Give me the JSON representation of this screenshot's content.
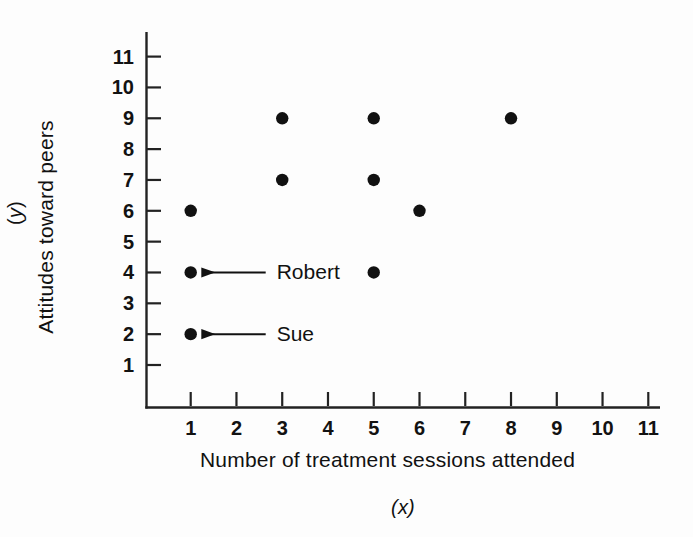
{
  "chart_data": {
    "type": "scatter",
    "title": "",
    "xlabel": "Number of treatment sessions attended",
    "xvar": "(x)",
    "ylabel": "Attitudes toward peers",
    "yvar": "(y)",
    "xlim": [
      0,
      11
    ],
    "ylim": [
      0,
      11
    ],
    "xticks": [
      1,
      2,
      3,
      4,
      5,
      6,
      7,
      8,
      9,
      10,
      11
    ],
    "yticks": [
      1,
      2,
      3,
      4,
      5,
      6,
      7,
      8,
      9,
      10,
      11
    ],
    "xtick_labels": [
      "1",
      "2",
      "3",
      "4",
      "5",
      "6",
      "7",
      "8",
      "9",
      "10",
      "11"
    ],
    "ytick_labels": [
      "1",
      "2",
      "3",
      "4",
      "5",
      "6",
      "7",
      "8",
      "9",
      "10",
      "11"
    ],
    "grid": false,
    "legend": false,
    "marker": "filled-circle",
    "marker_color": "#111111",
    "points": [
      {
        "x": 1,
        "y": 6
      },
      {
        "x": 1,
        "y": 4,
        "label": "Robert"
      },
      {
        "x": 1,
        "y": 2,
        "label": "Sue"
      },
      {
        "x": 3,
        "y": 9
      },
      {
        "x": 3,
        "y": 7
      },
      {
        "x": 5,
        "y": 9
      },
      {
        "x": 5,
        "y": 7
      },
      {
        "x": 5,
        "y": 4
      },
      {
        "x": 6,
        "y": 6
      },
      {
        "x": 8,
        "y": 9
      }
    ],
    "annotations": [
      {
        "text": "Robert",
        "points_to": {
          "x": 1,
          "y": 4
        },
        "arrow": "left"
      },
      {
        "text": "Sue",
        "points_to": {
          "x": 1,
          "y": 2
        },
        "arrow": "left"
      }
    ]
  },
  "axes": {
    "x_title": "Number of treatment sessions attended",
    "x_var": "(x)",
    "y_title": "Attitudes toward peers",
    "y_var": "(y)"
  },
  "colors": {
    "ink": "#111111",
    "axis": "#222222",
    "background": "#fdfdfd"
  }
}
